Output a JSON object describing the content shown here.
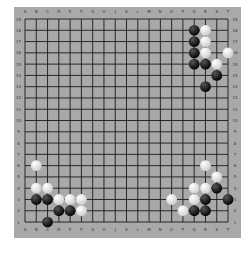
{
  "board": {
    "size": 19,
    "columns": [
      "A",
      "B",
      "C",
      "D",
      "E",
      "F",
      "G",
      "H",
      "J",
      "K",
      "L",
      "M",
      "N",
      "O",
      "P",
      "Q",
      "R",
      "S",
      "T"
    ],
    "rows": [
      19,
      18,
      17,
      16,
      15,
      14,
      13,
      12,
      11,
      10,
      9,
      8,
      7,
      6,
      5,
      4,
      3,
      2,
      1
    ],
    "colors": {
      "background": "#a9a9a9",
      "lines": "#1a1a1a",
      "black_stone": "#111111",
      "white_stone": "#f2f2f2"
    },
    "stones": [
      {
        "color": "black",
        "pos": "Q18"
      },
      {
        "color": "white",
        "pos": "R18"
      },
      {
        "color": "black",
        "pos": "Q17"
      },
      {
        "color": "white",
        "pos": "R17"
      },
      {
        "color": "black",
        "pos": "Q16"
      },
      {
        "color": "white",
        "pos": "R16"
      },
      {
        "color": "white",
        "pos": "T16"
      },
      {
        "color": "black",
        "pos": "Q15"
      },
      {
        "color": "black",
        "pos": "R15"
      },
      {
        "color": "white",
        "pos": "S15"
      },
      {
        "color": "black",
        "pos": "S14"
      },
      {
        "color": "black",
        "pos": "R13"
      },
      {
        "color": "white",
        "pos": "B6"
      },
      {
        "color": "white",
        "pos": "B4"
      },
      {
        "color": "white",
        "pos": "C4"
      },
      {
        "color": "black",
        "pos": "B3"
      },
      {
        "color": "black",
        "pos": "C3"
      },
      {
        "color": "white",
        "pos": "D3"
      },
      {
        "color": "white",
        "pos": "E3"
      },
      {
        "color": "white",
        "pos": "F3"
      },
      {
        "color": "black",
        "pos": "D2"
      },
      {
        "color": "black",
        "pos": "E2"
      },
      {
        "color": "white",
        "pos": "F2"
      },
      {
        "color": "black",
        "pos": "C1"
      },
      {
        "color": "white",
        "pos": "R6"
      },
      {
        "color": "white",
        "pos": "S5"
      },
      {
        "color": "white",
        "pos": "Q4"
      },
      {
        "color": "white",
        "pos": "R4"
      },
      {
        "color": "black",
        "pos": "S4"
      },
      {
        "color": "white",
        "pos": "O3"
      },
      {
        "color": "white",
        "pos": "Q3"
      },
      {
        "color": "black",
        "pos": "R3"
      },
      {
        "color": "black",
        "pos": "T3"
      },
      {
        "color": "white",
        "pos": "P2"
      },
      {
        "color": "black",
        "pos": "Q2"
      },
      {
        "color": "black",
        "pos": "R2"
      }
    ]
  }
}
